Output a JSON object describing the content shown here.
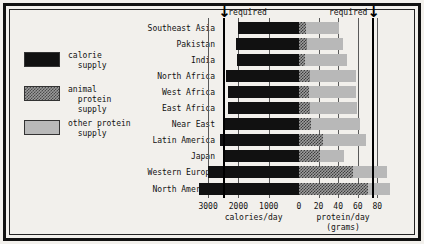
{
  "chart_data": {
    "type": "bar",
    "title": "",
    "subtitle": "",
    "orientation": "horizontal-diverging",
    "categories": [
      "Southeast Asia",
      "Pakistan",
      "India",
      "North Africa",
      "West Africa",
      "East Africa",
      "Near East",
      "Latin America",
      "Japan",
      "Western Europe",
      "North America"
    ],
    "series": [
      {
        "name": "calorie supply",
        "unit": "calories/day",
        "axis": "left",
        "color": "#111111",
        "values": [
          2030,
          2080,
          2060,
          2420,
          2360,
          2330,
          2440,
          2620,
          2470,
          3020,
          3300
        ]
      },
      {
        "name": "animal protein supply",
        "unit": "grams/day",
        "axis": "right",
        "color": "#9d9d9d",
        "values": [
          7,
          8,
          6,
          11,
          10,
          11,
          12,
          25,
          21,
          55,
          70
        ]
      },
      {
        "name": "other protein supply",
        "unit": "grams/day",
        "axis": "right",
        "color": "#b8b8b8",
        "values": [
          34,
          37,
          43,
          47,
          48,
          48,
          50,
          43,
          25,
          35,
          23
        ]
      }
    ],
    "left_axis": {
      "label": "calories/day",
      "ticks": [
        3000,
        2000,
        1000,
        0
      ],
      "tick_labels": [
        "3000",
        "2000",
        "1000",
        "0"
      ],
      "max": 3400,
      "required": 2500,
      "required_label": "required"
    },
    "right_axis": {
      "label": "protein/day",
      "label_2": "(grams)",
      "ticks": [
        0,
        20,
        40,
        60,
        80
      ],
      "tick_labels": [
        "0",
        "20",
        "40",
        "60",
        "80"
      ],
      "max": 95,
      "required": 75,
      "required_label": "required"
    },
    "grid": true,
    "legend_position": "left-outside"
  },
  "legend": {
    "items": [
      {
        "swatch": "calorie-supply-swatch",
        "line1": "calorie",
        "line2": "  supply",
        "line3": ""
      },
      {
        "swatch": "animal-protein-swatch",
        "line1": "animal",
        "line2": "  protein",
        "line3": "  supply"
      },
      {
        "swatch": "other-protein-swatch",
        "line1": "other protein",
        "line2": "  supply",
        "line3": ""
      }
    ]
  },
  "markers": {
    "left_required_text": "required",
    "right_required_text": "required",
    "arrow_glyph": "↓"
  }
}
